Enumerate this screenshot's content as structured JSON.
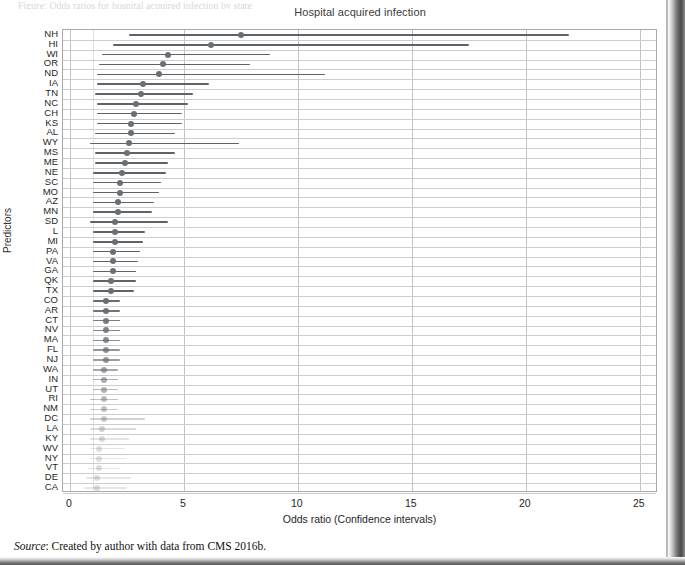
{
  "page": {
    "top_cut_text": "Figure: Odds ratios for hospital acquired infection by state",
    "source_prefix": "Source",
    "source_text": ": Created by author with data from CMS 2016b."
  },
  "chart_data": {
    "type": "scatter",
    "subtype": "forest-plot",
    "title": "Hospital acquired infection",
    "xlabel": "Odds ratio (Confidence intervals)",
    "ylabel": "Predictors",
    "xlim": [
      -0.3,
      25.8
    ],
    "xticks": [
      0,
      5,
      10,
      15,
      20,
      25
    ],
    "xticklabels": [
      "0",
      "5",
      "10",
      "15",
      "20",
      "25"
    ],
    "grid": "both",
    "legend": "none",
    "marker_color": "#6a6f76",
    "line_color": "#5f6368",
    "categories": [
      "NH",
      "HI",
      "WI",
      "OR",
      "ND",
      "IA",
      "TN",
      "NC",
      "CH",
      "KS",
      "AL",
      "WY",
      "MS",
      "ME",
      "NE",
      "SC",
      "MO",
      "AZ",
      "MN",
      "SD",
      "L",
      "MI",
      "PA",
      "VA",
      "GA",
      "QK",
      "TX",
      "CO",
      "AR",
      "CT",
      "NV",
      "MA",
      "FL",
      "NJ",
      "WA",
      "IN",
      "UT",
      "RI",
      "NM",
      "DC",
      "LA",
      "KY",
      "WV",
      "NY",
      "VT",
      "DE",
      "CA"
    ],
    "points": [
      {
        "label": "NH",
        "or": 7.5,
        "lo": 2.6,
        "hi": 21.9
      },
      {
        "label": "HI",
        "or": 6.2,
        "lo": 1.9,
        "hi": 17.5
      },
      {
        "label": "WI",
        "or": 4.3,
        "lo": 1.4,
        "hi": 8.8
      },
      {
        "label": "OR",
        "or": 4.1,
        "lo": 1.3,
        "hi": 7.9
      },
      {
        "label": "ND",
        "or": 3.9,
        "lo": 1.2,
        "hi": 11.2
      },
      {
        "label": "IA",
        "or": 3.2,
        "lo": 1.2,
        "hi": 6.1
      },
      {
        "label": "TN",
        "or": 3.1,
        "lo": 1.1,
        "hi": 5.4
      },
      {
        "label": "NC",
        "or": 2.9,
        "lo": 1.2,
        "hi": 5.2
      },
      {
        "label": "CH",
        "or": 2.8,
        "lo": 1.2,
        "hi": 4.9
      },
      {
        "label": "KS",
        "or": 2.7,
        "lo": 1.2,
        "hi": 4.9
      },
      {
        "label": "AL",
        "or": 2.7,
        "lo": 1.1,
        "hi": 4.6
      },
      {
        "label": "WY",
        "or": 2.6,
        "lo": 0.9,
        "hi": 7.4
      },
      {
        "label": "MS",
        "or": 2.5,
        "lo": 1.1,
        "hi": 4.6
      },
      {
        "label": "ME",
        "or": 2.4,
        "lo": 1.1,
        "hi": 4.3
      },
      {
        "label": "NE",
        "or": 2.3,
        "lo": 1.0,
        "hi": 4.2
      },
      {
        "label": "SC",
        "or": 2.2,
        "lo": 1.0,
        "hi": 4.0
      },
      {
        "label": "MO",
        "or": 2.2,
        "lo": 1.0,
        "hi": 3.9
      },
      {
        "label": "AZ",
        "or": 2.1,
        "lo": 1.0,
        "hi": 3.7
      },
      {
        "label": "MN",
        "or": 2.1,
        "lo": 1.0,
        "hi": 3.6
      },
      {
        "label": "SD",
        "or": 2.0,
        "lo": 0.9,
        "hi": 4.3
      },
      {
        "label": "L",
        "or": 2.0,
        "lo": 1.0,
        "hi": 3.3
      },
      {
        "label": "MI",
        "or": 2.0,
        "lo": 1.0,
        "hi": 3.2
      },
      {
        "label": "PA",
        "or": 1.9,
        "lo": 1.0,
        "hi": 3.1
      },
      {
        "label": "VA",
        "or": 1.9,
        "lo": 1.0,
        "hi": 3.0
      },
      {
        "label": "GA",
        "or": 1.9,
        "lo": 1.0,
        "hi": 2.9
      },
      {
        "label": "QK",
        "or": 1.8,
        "lo": 1.0,
        "hi": 2.9
      },
      {
        "label": "TX",
        "or": 1.8,
        "lo": 1.0,
        "hi": 2.8
      },
      {
        "label": "CO",
        "or": 1.6,
        "lo": 1.0,
        "hi": 2.2
      },
      {
        "label": "AR",
        "or": 1.6,
        "lo": 1.0,
        "hi": 2.2
      },
      {
        "label": "CT",
        "or": 1.6,
        "lo": 1.0,
        "hi": 2.2
      },
      {
        "label": "NV",
        "or": 1.6,
        "lo": 1.0,
        "hi": 2.2
      },
      {
        "label": "MA",
        "or": 1.6,
        "lo": 1.0,
        "hi": 2.2
      },
      {
        "label": "FL",
        "or": 1.6,
        "lo": 1.0,
        "hi": 2.2
      },
      {
        "label": "NJ",
        "or": 1.6,
        "lo": 1.0,
        "hi": 2.2
      },
      {
        "label": "WA",
        "or": 1.5,
        "lo": 1.0,
        "hi": 2.1
      },
      {
        "label": "IN",
        "or": 1.5,
        "lo": 1.0,
        "hi": 2.1
      },
      {
        "label": "UT",
        "or": 1.5,
        "lo": 1.0,
        "hi": 2.1
      },
      {
        "label": "RI",
        "or": 1.5,
        "lo": 0.9,
        "hi": 2.1
      },
      {
        "label": "NM",
        "or": 1.5,
        "lo": 0.9,
        "hi": 2.1
      },
      {
        "label": "DC",
        "or": 1.5,
        "lo": 0.9,
        "hi": 3.3
      },
      {
        "label": "LA",
        "or": 1.4,
        "lo": 0.9,
        "hi": 2.9
      },
      {
        "label": "KY",
        "or": 1.4,
        "lo": 0.9,
        "hi": 2.6
      },
      {
        "label": "WV",
        "or": 1.3,
        "lo": 0.9,
        "hi": 2.4
      },
      {
        "label": "NY",
        "or": 1.3,
        "lo": 0.9,
        "hi": 2.5
      },
      {
        "label": "VT",
        "or": 1.3,
        "lo": 0.8,
        "hi": 2.2
      },
      {
        "label": "DE",
        "or": 1.2,
        "lo": 0.7,
        "hi": 2.7
      },
      {
        "label": "CA",
        "or": 1.2,
        "lo": 0.6,
        "hi": 2.5
      }
    ]
  }
}
